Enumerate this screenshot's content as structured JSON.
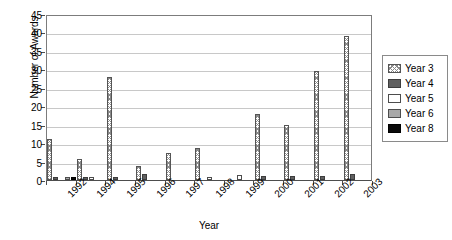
{
  "chart_data": {
    "type": "bar",
    "title": "",
    "xlabel": "Year",
    "ylabel": "Number of Awards",
    "ylim": [
      0,
      45
    ],
    "ytick_step": 5,
    "yticks": [
      0,
      5,
      10,
      15,
      20,
      25,
      30,
      35,
      40,
      45
    ],
    "grid": true,
    "legend_position": "right",
    "categories": [
      "1992",
      "1994",
      "1995",
      "1996",
      "1997",
      "1998",
      "1999",
      "2000",
      "2001",
      "2002",
      "2003"
    ],
    "series": [
      {
        "name": "Year 3",
        "color": "#8a8a8a",
        "pattern": "crosshatch",
        "values": [
          11,
          5.8,
          28,
          3.8,
          7.3,
          8.6,
          0,
          18,
          15,
          29.5,
          39
        ]
      },
      {
        "name": "Year 4",
        "color": "#606060",
        "pattern": "solid",
        "values": [
          0.8,
          0.8,
          0.7,
          1.6,
          0,
          0,
          0,
          1,
          1,
          1,
          1.6
        ]
      },
      {
        "name": "Year 5",
        "color": "#ffffff",
        "pattern": "solid",
        "values": [
          0,
          0.8,
          0,
          0,
          0,
          0.7,
          1.4,
          0,
          0,
          0,
          0
        ]
      },
      {
        "name": "Year 6",
        "color": "#a8a8a8",
        "pattern": "solid",
        "values": [
          0.8,
          0,
          0,
          0,
          0,
          0,
          0,
          0,
          0,
          0,
          0
        ]
      },
      {
        "name": "Year 8",
        "color": "#0a0a0a",
        "pattern": "solid",
        "values": [
          0.9,
          0,
          0,
          0,
          0,
          0,
          0,
          0,
          0,
          0,
          0
        ]
      }
    ]
  },
  "legend": {
    "items": [
      {
        "label": "Year 3"
      },
      {
        "label": "Year 4"
      },
      {
        "label": "Year 5"
      },
      {
        "label": "Year 6"
      },
      {
        "label": "Year 8"
      }
    ]
  }
}
